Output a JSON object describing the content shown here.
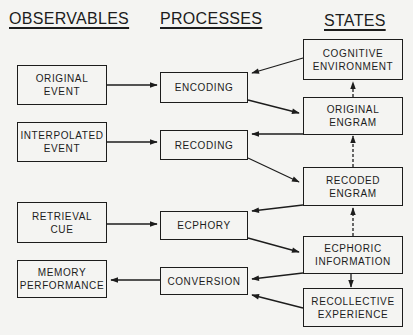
{
  "headings": {
    "observables": "OBSERVABLES",
    "processes": "PROCESSES",
    "states": "STATES"
  },
  "observables": [
    {
      "id": "original-event",
      "lines": [
        "ORIGINAL",
        "EVENT"
      ]
    },
    {
      "id": "interpolated-event",
      "lines": [
        "INTERPOLATED",
        "EVENT"
      ]
    },
    {
      "id": "retrieval-cue",
      "lines": [
        "RETRIEVAL",
        "CUE"
      ]
    },
    {
      "id": "memory-performance",
      "lines": [
        "MEMORY",
        "PERFORMANCE"
      ]
    }
  ],
  "processes": [
    {
      "id": "encoding",
      "lines": [
        "ENCODING"
      ]
    },
    {
      "id": "recoding",
      "lines": [
        "RECODING"
      ]
    },
    {
      "id": "ecphory",
      "lines": [
        "ECPHORY"
      ]
    },
    {
      "id": "conversion",
      "lines": [
        "CONVERSION"
      ]
    }
  ],
  "states": [
    {
      "id": "cognitive-environment",
      "lines": [
        "COGNITIVE",
        "ENVIRONMENT"
      ]
    },
    {
      "id": "original-engram",
      "lines": [
        "ORIGINAL",
        "ENGRAM"
      ]
    },
    {
      "id": "recoded-engram",
      "lines": [
        "RECODED",
        "ENGRAM"
      ]
    },
    {
      "id": "ecphoric-information",
      "lines": [
        "ECPHORIC",
        "INFORMATION"
      ]
    },
    {
      "id": "recollective-experience",
      "lines": [
        "RECOLLECTIVE",
        "EXPERIENCE"
      ]
    }
  ],
  "connections": [
    {
      "from": "original-event",
      "to": "encoding",
      "style": "solid"
    },
    {
      "from": "interpolated-event",
      "to": "recoding",
      "style": "solid"
    },
    {
      "from": "retrieval-cue",
      "to": "ecphory",
      "style": "solid"
    },
    {
      "from": "conversion",
      "to": "memory-performance",
      "style": "solid"
    },
    {
      "from": "cognitive-environment",
      "to": "encoding",
      "style": "solid"
    },
    {
      "from": "encoding",
      "to": "original-engram",
      "style": "solid"
    },
    {
      "from": "original-engram",
      "to": "recoding",
      "style": "solid"
    },
    {
      "from": "recoding",
      "to": "recoded-engram",
      "style": "solid"
    },
    {
      "from": "recoded-engram",
      "to": "ecphory",
      "style": "solid"
    },
    {
      "from": "ecphory",
      "to": "ecphoric-information",
      "style": "solid"
    },
    {
      "from": "ecphoric-information",
      "to": "conversion",
      "style": "solid"
    },
    {
      "from": "recollective-experience",
      "to": "conversion",
      "style": "solid"
    },
    {
      "from": "original-engram",
      "to": "cognitive-environment",
      "style": "dashed"
    },
    {
      "from": "recoded-engram",
      "to": "original-engram",
      "style": "dashed"
    },
    {
      "from": "ecphoric-information",
      "to": "recoded-engram",
      "style": "dashed"
    },
    {
      "from": "ecphoric-information",
      "to": "recollective-experience",
      "style": "solid"
    }
  ],
  "colors": {
    "ink": "#1c1c1c",
    "paper": "#f4f4f2"
  }
}
